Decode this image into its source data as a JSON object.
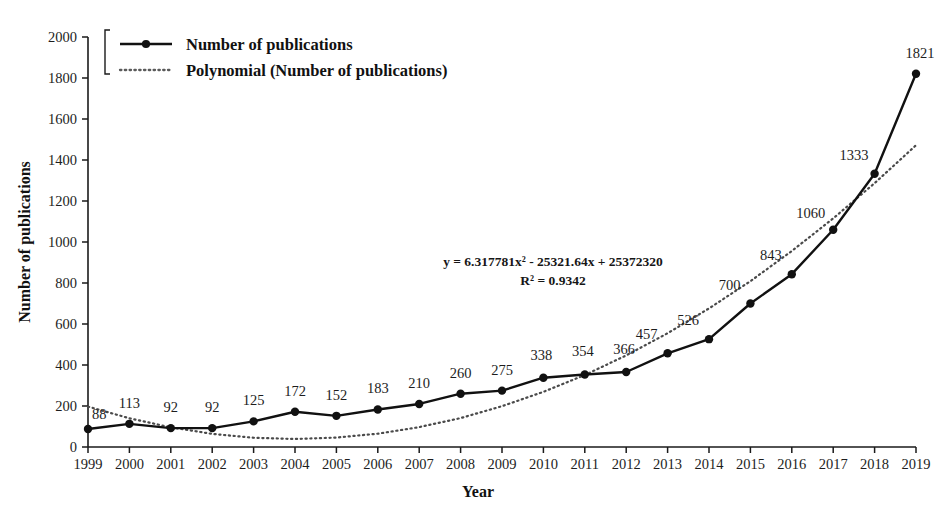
{
  "chart_data": {
    "type": "line",
    "title": "",
    "xlabel": "Year",
    "ylabel": "Number of publications",
    "categories": [
      1999,
      2000,
      2001,
      2002,
      2003,
      2004,
      2005,
      2006,
      2007,
      2008,
      2009,
      2010,
      2011,
      2012,
      2013,
      2014,
      2015,
      2016,
      2017,
      2018,
      2019
    ],
    "xtick_labels": [
      "1999",
      "2000",
      "2001",
      "2002",
      "2003",
      "2004",
      "2005",
      "2006",
      "2007",
      "2008",
      "2009",
      "2010",
      "2011",
      "2012",
      "2013",
      "2014",
      "2015",
      "2016",
      "2017",
      "2018",
      "2019"
    ],
    "ytick_labels": [
      "0",
      "200",
      "400",
      "600",
      "800",
      "1000",
      "1200",
      "1400",
      "1600",
      "1800",
      "2000"
    ],
    "yticks": [
      0,
      200,
      400,
      600,
      800,
      1000,
      1200,
      1400,
      1600,
      1800,
      2000
    ],
    "ylim": [
      0,
      2000
    ],
    "xlim": [
      1999,
      2019
    ],
    "grid": false,
    "legend_position": "top-left",
    "series": [
      {
        "name": "Number of publications",
        "style": "solid-marker",
        "color": "#1a1a1a",
        "values": [
          88,
          113,
          92,
          92,
          125,
          172,
          152,
          183,
          210,
          260,
          275,
          338,
          354,
          366,
          457,
          526,
          700,
          843,
          1060,
          1333,
          1821
        ],
        "data_labels": [
          "88",
          "113",
          "92",
          "92",
          "125",
          "172",
          "152",
          "183",
          "210",
          "260",
          "275",
          "338",
          "354",
          "366",
          "457",
          "526",
          "700",
          "843",
          "1060",
          "1333",
          "1821"
        ]
      },
      {
        "name": "Polynomial (Number of publications)",
        "style": "dotted",
        "color": "#555555",
        "equation": "y = 6.317781x² - 25321.64x + 25372320",
        "r_squared": "R² = 0.9342",
        "coefficients": {
          "a": 6.317781,
          "b": -25321.64,
          "c": 25372320
        },
        "values": [
          197,
          140,
          96,
          64,
          45,
          39,
          46,
          65,
          97,
          141,
          199,
          269,
          351,
          447,
          555,
          676,
          809,
          956,
          1115,
          1287,
          1472
        ]
      }
    ],
    "annotations": [
      {
        "name": "trendline-equation",
        "text": "y = 6.317781x² - 25321.64x + 25372320",
        "x": 553,
        "y": 265
      },
      {
        "name": "r-squared",
        "text": "R² = 0.9342",
        "x": 553,
        "y": 284
      }
    ],
    "legend": [
      {
        "label": "Number of publications",
        "marker": "solid-line-with-dot"
      },
      {
        "label": "Polynomial (Number of publications)",
        "marker": "dotted-line"
      }
    ]
  }
}
